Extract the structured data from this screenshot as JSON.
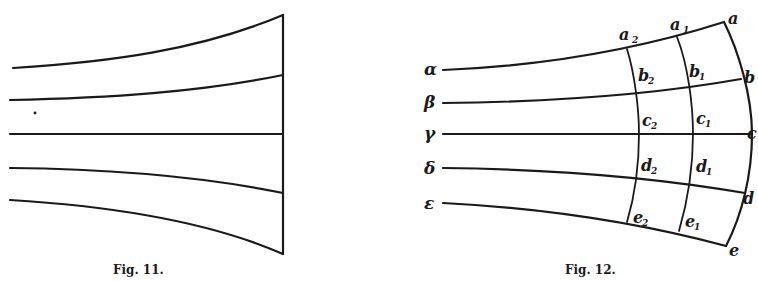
{
  "figures": [
    {
      "id": "fig11",
      "caption": "Fig. 11.",
      "description": "Five flow lines diverging toward a vertical end line",
      "lines": 5
    },
    {
      "id": "fig12",
      "caption": "Fig. 12.",
      "description": "Five flow lines with three transverse arcs forming a curvilinear grid",
      "line_labels": [
        "α",
        "β",
        "γ",
        "δ",
        "ε"
      ],
      "outer_arc_labels": [
        "a",
        "b",
        "c",
        "d",
        "e"
      ],
      "arc1_top_label": "a",
      "arc1_top_sub": "1",
      "arc2_top_label": "a",
      "arc2_top_sub": "2",
      "cells_col1": [
        {
          "letter": "b",
          "sub": "1"
        },
        {
          "letter": "c",
          "sub": "1"
        },
        {
          "letter": "d",
          "sub": "1"
        },
        {
          "letter": "e",
          "sub": "1"
        }
      ],
      "cells_col2": [
        {
          "letter": "b",
          "sub": "2"
        },
        {
          "letter": "c",
          "sub": "2"
        },
        {
          "letter": "d",
          "sub": "2"
        },
        {
          "letter": "e",
          "sub": "2"
        }
      ]
    }
  ]
}
